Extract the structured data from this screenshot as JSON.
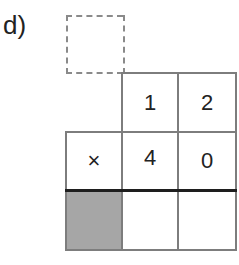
{
  "exercise": {
    "label": "d)",
    "rows": [
      {
        "name": "carry-row",
        "cells": [
          {
            "value": "",
            "style": "dashed"
          }
        ]
      },
      {
        "name": "multiplicand-row",
        "cells": [
          {
            "value": "1"
          },
          {
            "value": "2"
          }
        ]
      },
      {
        "name": "multiplier-row",
        "cells": [
          {
            "value": "×"
          },
          {
            "value": "4"
          },
          {
            "value": "0"
          }
        ]
      },
      {
        "name": "result-row",
        "cells": [
          {
            "value": "",
            "style": "shaded"
          },
          {
            "value": ""
          },
          {
            "value": ""
          }
        ]
      }
    ],
    "colors": {
      "grid": "#7d7d7d",
      "shaded": "#a6a6a6",
      "rule": "#1e1e1e",
      "dashed": "#8a8a8a"
    }
  }
}
